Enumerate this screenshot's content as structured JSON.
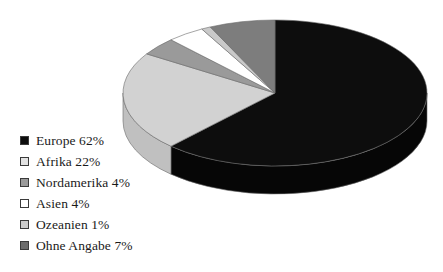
{
  "chart_data": {
    "type": "pie",
    "title": "",
    "subtitle": "",
    "xlabel": "",
    "ylabel": "",
    "grid": false,
    "legend_position": "bottom-left",
    "three_d": true,
    "start_angle_deg": 0,
    "direction": "clockwise",
    "categories": [
      "Europe",
      "Afrika",
      "Nordamerika",
      "Asien",
      "Ozeanien",
      "Ohne Angabe"
    ],
    "values": [
      62,
      22,
      4,
      4,
      1,
      7
    ],
    "value_unit": "%",
    "labels": [
      "Europe 62%",
      "Afrika 22%",
      "Nordamerika 4%",
      "Asien 4%",
      "Ozeanien 1%",
      "Ohne Angabe 7%"
    ],
    "slice_colors": [
      "#0d0d0d",
      "#d2d2d2",
      "#9a9a9a",
      "#ffffff",
      "#c9c9c9",
      "#7d7d7d"
    ],
    "slice_side_colors": [
      "#060606",
      "#c0c0c0",
      "#8a8a8a",
      "#e8e8e8",
      "#b8b8b8",
      "#6e6e6e"
    ],
    "slices": [
      {
        "name": "Europe",
        "value": 62,
        "label": "Europe 62%",
        "color": "#0d0d0d",
        "side_color": "#060606"
      },
      {
        "name": "Afrika",
        "value": 22,
        "label": "Afrika 22%",
        "color": "#d2d2d2",
        "side_color": "#c0c0c0"
      },
      {
        "name": "Nordamerika",
        "value": 4,
        "label": "Nordamerika 4%",
        "color": "#9a9a9a",
        "side_color": "#8a8a8a"
      },
      {
        "name": "Asien",
        "value": 4,
        "label": "Asien 4%",
        "color": "#ffffff",
        "side_color": "#e8e8e8"
      },
      {
        "name": "Ozeanien",
        "value": 1,
        "label": "Ozeanien 1%",
        "color": "#c9c9c9",
        "side_color": "#b8b8b8"
      },
      {
        "name": "Ohne Angabe",
        "value": 7,
        "label": "Ohne Angabe 7%",
        "color": "#7d7d7d",
        "side_color": "#6e6e6e"
      }
    ]
  },
  "legend": {
    "items": [
      {
        "label": "Europe 62%",
        "swatch": "#0d0d0d"
      },
      {
        "label": "Afrika 22%",
        "swatch": "#e2e2e2"
      },
      {
        "label": "Nordamerika 4%",
        "swatch": "#9a9a9a"
      },
      {
        "label": "Asien 4%",
        "swatch": "#ffffff"
      },
      {
        "label": "Ozeanien 1%",
        "swatch": "#cccccc"
      },
      {
        "label": "Ohne Angabe 7%",
        "swatch": "#6b6b6b"
      }
    ]
  },
  "colors": {
    "background": "#ffffff",
    "text": "#1a1a1a",
    "swatch_border": "#3a3a3a",
    "slice_outline": "#6a6a6a"
  }
}
